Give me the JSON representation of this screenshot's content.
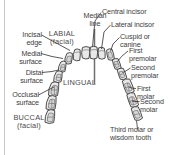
{
  "figure": {
    "type": "labeled-anatomical-diagram",
    "background_color": "#ffffff",
    "tooth_fill_color": "#e8e8e8",
    "tooth_outline_color": "#3a3a3a",
    "leader_line_color": "#2e2e2e",
    "median_line_color": "#6f6f6f",
    "text_color": "#3d3d3d"
  },
  "labels": {
    "median_line": "Median\nline",
    "central_incisor": "Central incisor",
    "lateral_incisor": "Lateral incisor",
    "cuspid_or_canine": "Cuspid or\ncanine",
    "first_premolar": "First\npremolar",
    "second_premolar": "Second\npremolar",
    "first_molar": "First\nmolar",
    "second_molar": "Second\nmolar",
    "third_molar": "Third molar or\nwisdom tooth",
    "incisal_edge": "Incisal\nedge",
    "medial_surface": "Medial\nsurface",
    "distal_surface": "Distal\nsurface",
    "occlusal_surface": "Occlusal\nsurface",
    "labial_facial": "LABIAL\n(facial)",
    "buccal_facial": "BUCCAL\n(facial)",
    "lingual": "LINGUAL"
  },
  "surfaces": {
    "labial": "LABIAL",
    "labial_sub": "(facial)",
    "buccal": "BUCCAL",
    "buccal_sub": "(facial)",
    "lingual": "LINGUAL"
  },
  "tooth_names_right_quadrant": [
    "Central incisor",
    "Lateral incisor",
    "Cuspid or canine",
    "First premolar",
    "Second premolar",
    "First molar",
    "Second molar",
    "Third molar or wisdom tooth"
  ],
  "surface_terms_left": [
    "Incisal edge",
    "Medial surface",
    "Distal surface",
    "Occlusal surface"
  ]
}
